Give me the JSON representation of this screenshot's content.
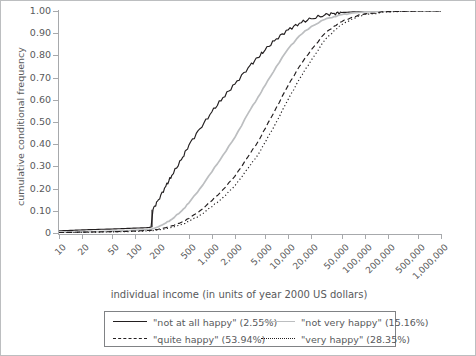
{
  "chart_data": {
    "type": "line",
    "title": "",
    "xlabel": "individual income (in units of year 2000 US dollars)",
    "ylabel": "cumulative conditional frequency",
    "xscale": "log",
    "xlim": [
      10,
      1000000
    ],
    "ylim": [
      0,
      1.0
    ],
    "grid": false,
    "legend_position": "bottom",
    "xticks": [
      10,
      20,
      50,
      100,
      200,
      500,
      1000,
      2000,
      5000,
      10000,
      20000,
      50000,
      100000,
      200000,
      500000,
      1000000
    ],
    "xticklabels": [
      "10",
      "20",
      "50",
      "100",
      "200",
      "500",
      "1,000",
      "2,000",
      "5,000",
      "10,000",
      "20,000",
      "50,000",
      "100,000",
      "200,000",
      "500,000",
      "1,000,000"
    ],
    "yticks": [
      0,
      0.1,
      0.2,
      0.3,
      0.4,
      0.5,
      0.6,
      0.7,
      0.8,
      0.9,
      1.0
    ],
    "yticklabels": [
      "0",
      "0.10",
      "0.20",
      "0.30",
      "0.40",
      "0.50",
      "0.60",
      "0.70",
      "0.80",
      "0.90",
      "1.00"
    ],
    "x": [
      10,
      15,
      20,
      30,
      50,
      70,
      100,
      140,
      160,
      170,
      200,
      250,
      300,
      400,
      500,
      700,
      1000,
      1400,
      2000,
      3000,
      4000,
      5000,
      7000,
      10000,
      14000,
      20000,
      30000,
      40000,
      50000,
      70000,
      100000,
      200000,
      500000,
      1000000
    ],
    "series": [
      {
        "name": "\"not at all happy\"",
        "share_percent": 2.55,
        "style": "solid",
        "color": "#231f20",
        "values": [
          0.01,
          0.012,
          0.014,
          0.016,
          0.018,
          0.02,
          0.022,
          0.024,
          0.026,
          0.105,
          0.15,
          0.21,
          0.26,
          0.33,
          0.395,
          0.47,
          0.545,
          0.61,
          0.67,
          0.745,
          0.79,
          0.825,
          0.875,
          0.915,
          0.945,
          0.965,
          0.982,
          0.989,
          0.993,
          0.996,
          0.998,
          0.999,
          1.0,
          1.0
        ]
      },
      {
        "name": "\"not very happy\"",
        "share_percent": 15.16,
        "style": "solid",
        "color": "#bcbec0",
        "values": [
          0.003,
          0.004,
          0.005,
          0.006,
          0.008,
          0.01,
          0.012,
          0.015,
          0.017,
          0.019,
          0.028,
          0.045,
          0.062,
          0.098,
          0.135,
          0.2,
          0.275,
          0.35,
          0.43,
          0.54,
          0.61,
          0.665,
          0.75,
          0.83,
          0.888,
          0.93,
          0.962,
          0.975,
          0.983,
          0.991,
          0.996,
          0.999,
          1.0,
          1.0
        ]
      },
      {
        "name": "\"quite happy\"",
        "share_percent": 53.94,
        "style": "dashed",
        "color": "#231f20",
        "values": [
          0.002,
          0.003,
          0.004,
          0.005,
          0.006,
          0.007,
          0.009,
          0.011,
          0.012,
          0.013,
          0.017,
          0.024,
          0.032,
          0.048,
          0.065,
          0.1,
          0.145,
          0.195,
          0.255,
          0.345,
          0.41,
          0.47,
          0.565,
          0.665,
          0.75,
          0.825,
          0.898,
          0.932,
          0.952,
          0.973,
          0.987,
          0.997,
          1.0,
          1.0
        ]
      },
      {
        "name": "\"very happy\"",
        "share_percent": 28.35,
        "style": "dotted",
        "color": "#231f20",
        "values": [
          0.002,
          0.002,
          0.003,
          0.004,
          0.005,
          0.006,
          0.007,
          0.009,
          0.01,
          0.011,
          0.014,
          0.019,
          0.025,
          0.038,
          0.052,
          0.08,
          0.118,
          0.16,
          0.212,
          0.293,
          0.352,
          0.408,
          0.5,
          0.602,
          0.693,
          0.778,
          0.868,
          0.912,
          0.938,
          0.966,
          0.984,
          0.996,
          1.0,
          1.0
        ]
      }
    ]
  },
  "axes": {
    "y_title": "cumulative conditional frequency",
    "x_title": "individual income (in units of year 2000 US dollars)"
  },
  "legend": {
    "entries": [
      {
        "label": "\"not at all happy\" (2.55%)",
        "style": "solid-dark"
      },
      {
        "label": "\"not very happy\" (15.16%)",
        "style": "solid-light"
      },
      {
        "label": "\"quite happy\" (53.94%)",
        "style": "dashed"
      },
      {
        "label": "\"very happy\" (28.35%)",
        "style": "dotted"
      }
    ]
  },
  "colors": {
    "dark": "#231f20",
    "light": "#bcbec0",
    "axis": "#a7a9ac",
    "text": "#58595b"
  }
}
